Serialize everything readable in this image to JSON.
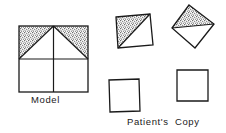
{
  "figure": {
    "background_color": "#ffffff",
    "stroke_color": "#1a1a1a",
    "stipple_color": "#5a5a5a",
    "width": 226,
    "height": 133
  },
  "captions": {
    "model": "Model",
    "patient": "Patient's  Copy"
  },
  "shapes": {
    "model": {
      "name": "model-figure",
      "description": "Upright square divided by horizontal and vertical midlines into four quadrants, with two diagonals from the top-centre vertex to the left and right midpoints forming a central triangle; the two upper corner triangles are stippled.",
      "square": {
        "x": 19,
        "y": 26,
        "width": 69,
        "height": 66
      },
      "shaded_regions": [
        "upper-left-corner-triangle",
        "upper-right-corner-triangle"
      ],
      "internal_lines": [
        "horizontal-midline",
        "vertical-midline",
        "left-diagonal",
        "right-diagonal"
      ]
    },
    "patient_copy_1": {
      "name": "patient-copy-shape-1",
      "description": "Slightly tilted square with the upper-left half shaded by a single diagonal, drawn at top-centre.",
      "rotation_degrees": -8,
      "shaded": true
    },
    "patient_copy_2": {
      "name": "patient-copy-shape-2",
      "description": "Strongly rotated square with a shaded triangle along its upper edge, drawn at top-right.",
      "rotation_degrees": -32,
      "shaded": true
    },
    "patient_copy_3": {
      "name": "patient-copy-shape-3",
      "description": "Plain unshaded square with no internal lines, drawn at lower-centre.",
      "rotation_degrees": -2,
      "shaded": false
    },
    "patient_copy_4": {
      "name": "patient-copy-shape-4",
      "description": "Plain unshaded square with no internal lines, drawn at lower-right.",
      "rotation_degrees": 0,
      "shaded": false
    }
  }
}
